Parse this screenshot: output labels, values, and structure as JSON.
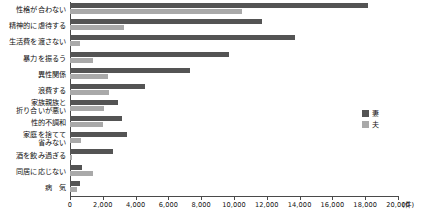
{
  "chart_data": {
    "type": "bar",
    "orientation": "horizontal",
    "title": "",
    "xlabel": "",
    "ylabel": "",
    "unit": "(件)",
    "xlim": [
      0,
      20000
    ],
    "grid": false,
    "legend_position": "right",
    "tick_labels": [
      "0",
      "2,000",
      "4,000",
      "6,000",
      "8,000",
      "10,000",
      "12,000",
      "14,000",
      "16,000",
      "18,000",
      "20,000"
    ],
    "tick_values": [
      0,
      2000,
      4000,
      6000,
      8000,
      10000,
      12000,
      14000,
      16000,
      18000,
      20000
    ],
    "categories": [
      "性格が合わない",
      "精神的に虐待する",
      "生活費を渡さない",
      "暴力を振るう",
      "異性関係",
      "浪費する",
      "家族親族と\n折り合いが悪い",
      "性的不調和",
      "家庭を捨てて\n省みない",
      "酒を飲み過ぎる",
      "同居に応じない",
      "病　気"
    ],
    "series": [
      {
        "name": "妻",
        "color": "#545454",
        "values": [
          18200,
          11700,
          13700,
          9700,
          7300,
          4600,
          2900,
          3200,
          3500,
          2600,
          750,
          600
        ]
      },
      {
        "name": "夫",
        "color": "#a9a9a9",
        "values": [
          10500,
          3300,
          600,
          1400,
          2300,
          2400,
          2100,
          2000,
          700,
          150,
          1400,
          400
        ]
      }
    ]
  },
  "legend": {
    "items": [
      {
        "label": "妻",
        "color": "#545454"
      },
      {
        "label": "夫",
        "color": "#a9a9a9"
      }
    ]
  },
  "axis": {
    "unit_label": "(件)"
  }
}
